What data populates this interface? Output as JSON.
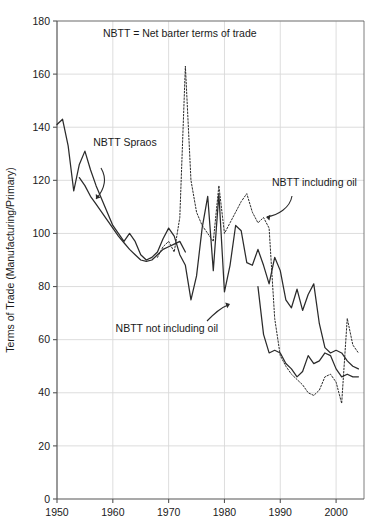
{
  "chart_data": {
    "type": "line",
    "title": "",
    "note": "NBTT = Net barter terms of trade",
    "xlabel": "",
    "ylabel": "Terms of Trade (Manufacturing/Primary)",
    "xlim": [
      1950,
      2005
    ],
    "ylim": [
      0,
      180
    ],
    "xticks": [
      1950,
      1960,
      1970,
      1980,
      1990,
      2000
    ],
    "yticks": [
      0,
      20,
      40,
      60,
      80,
      100,
      120,
      140,
      160,
      180
    ],
    "grid": true,
    "legend_position": "inline-annotations",
    "annotations": [
      {
        "name": "note",
        "text": "NBTT = Net barter terms of trade",
        "x": 1972,
        "y": 174
      },
      {
        "name": "spraos-label",
        "text": "NBTT Spraos",
        "x": 1956.5,
        "y": 133
      },
      {
        "name": "including-oil-label",
        "text": "NBTT including oil",
        "x": 1988.5,
        "y": 118
      },
      {
        "name": "not-including-oil-label",
        "text": "NBTT not including oil",
        "x": 1960.5,
        "y": 63
      }
    ],
    "series": [
      {
        "name": "NBTT Spraos",
        "style": "solid",
        "color": "#2b2b2b",
        "x": [
          1954,
          1955,
          1956,
          1957,
          1958,
          1959,
          1960,
          1961,
          1962,
          1963,
          1964,
          1965,
          1966,
          1967,
          1968,
          1969,
          1970,
          1971,
          1972,
          1973
        ],
        "values": [
          121,
          118,
          114,
          111,
          108,
          105,
          102,
          99,
          96.5,
          94,
          92,
          90,
          89.5,
          90,
          92,
          94,
          95,
          96,
          97,
          93
        ]
      },
      {
        "name": "NBTT not including oil",
        "style": "solid",
        "color": "#2b2b2b",
        "x": [
          1950,
          1951,
          1952,
          1953,
          1954,
          1955,
          1956,
          1957,
          1958,
          1959,
          1960,
          1961,
          1962,
          1963,
          1964,
          1965,
          1966,
          1967,
          1968,
          1969,
          1970,
          1971,
          1972,
          1973,
          1974,
          1975,
          1976,
          1977,
          1978,
          1979,
          1980,
          1981,
          1982,
          1983,
          1984,
          1985,
          1986,
          1987,
          1988,
          1989,
          1990,
          1991,
          1992,
          1993,
          1994,
          1995,
          1996,
          1997,
          1998,
          1999,
          2000,
          2001,
          2002,
          2003,
          2004
        ],
        "values": [
          141,
          143,
          133,
          116,
          126,
          131,
          124,
          118,
          113,
          108,
          103,
          100,
          97,
          100,
          97,
          92,
          90,
          91,
          93,
          98,
          102,
          99,
          92,
          88,
          75,
          84,
          102,
          114,
          86,
          115,
          78,
          88,
          103,
          101,
          89,
          88,
          94,
          88,
          81,
          91,
          86,
          75,
          72,
          79,
          71,
          77,
          81,
          66,
          57,
          55,
          56,
          55,
          52,
          50,
          49
        ]
      },
      {
        "name": "NBTT including oil",
        "style": "dotted",
        "color": "#2b2b2b",
        "x": [
          1968,
          1969,
          1970,
          1971,
          1972,
          1973,
          1974,
          1975,
          1976,
          1977,
          1978,
          1979,
          1980,
          1981,
          1982,
          1983,
          1984,
          1985,
          1986,
          1987,
          1988,
          1989,
          1990,
          1991,
          1992,
          1993,
          1994,
          1995,
          1996,
          1997,
          1998,
          1999,
          2000,
          2001,
          2002,
          2003,
          2004
        ],
        "values": [
          91,
          95,
          97,
          93,
          106,
          163,
          120,
          108,
          103,
          100,
          97,
          118,
          100,
          104,
          108,
          112,
          115,
          108,
          104,
          106,
          102,
          68,
          54,
          50,
          47,
          45,
          43,
          40,
          39,
          41,
          46,
          47,
          44,
          36,
          68,
          58,
          55
        ]
      }
    ],
    "solid_extra_segment": {
      "name": "NBTT not including oil continuation",
      "x": [
        1986,
        1987,
        1988,
        1989,
        1990,
        1991,
        1992,
        1993,
        1994,
        1995,
        1996,
        1997,
        1998,
        1999,
        2000,
        2001,
        2002,
        2003,
        2004
      ],
      "values": [
        80,
        62,
        55,
        56,
        55,
        51,
        49,
        46,
        48,
        54,
        51,
        52,
        55,
        54,
        49,
        46,
        47,
        46,
        46
      ]
    }
  },
  "axes": {
    "y_title": "Terms of Trade (Manufacturing/Primary)",
    "y_tick_labels": [
      "0",
      "20",
      "40",
      "60",
      "80",
      "100",
      "120",
      "140",
      "160",
      "180"
    ],
    "x_tick_labels": [
      "1950",
      "1960",
      "1970",
      "1980",
      "1990",
      "2000"
    ]
  },
  "colors": {
    "line": "#2b2b2b",
    "grid": "#d9d9d9",
    "axis": "#555555",
    "background": "#ffffff",
    "text": "#1a1a1a"
  }
}
